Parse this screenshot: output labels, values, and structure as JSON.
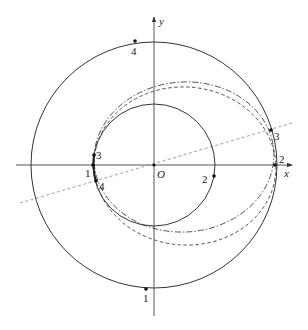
{
  "diagram": {
    "colors": {
      "line": "#333333",
      "dashed_line": "#888888",
      "background": "#ffffff"
    },
    "axes": {
      "x_label": "x",
      "y_label": "y",
      "origin_label": "O"
    },
    "inner_circle": {
      "center": [
        154,
        165
      ],
      "radius": 61,
      "style": "solid"
    },
    "outer_circle": {
      "center": [
        154,
        165
      ],
      "radius": 123,
      "style": "solid"
    },
    "transfer_orbit_dashdot": {
      "center": [
        184,
        157
      ],
      "rx": 90,
      "ry": 75,
      "rotation": -4,
      "style": "dash-dot"
    },
    "transfer_orbit_dashed": {
      "center": [
        185,
        166
      ],
      "rx": 91,
      "ry": 79,
      "rotation": 4,
      "style": "dashed"
    },
    "reference_line": {
      "from": [
        20,
        203
      ],
      "to": [
        292,
        123
      ],
      "style": "dashed",
      "passes_through": "O"
    },
    "points": [
      {
        "label": "4",
        "x": 135,
        "y": 41,
        "label_x": 131,
        "label_y": 54,
        "on": "outer circle top"
      },
      {
        "label": "1",
        "x": 146,
        "y": 289,
        "label_x": 143,
        "label_y": 302,
        "on": "outer circle bottom"
      },
      {
        "label": "3",
        "x": 271,
        "y": 130,
        "label_x": 274,
        "label_y": 139,
        "on": "outer circle right upper"
      },
      {
        "label": "2",
        "x": 275,
        "y": 165,
        "label_x": 279,
        "label_y": 163,
        "on": "outer circle right on x-axis"
      },
      {
        "label": "3",
        "x": 94,
        "y": 155,
        "label_x": 96,
        "label_y": 159,
        "on": "inner circle left upper"
      },
      {
        "label": "1",
        "x": 93,
        "y": 165,
        "label_x": 85,
        "label_y": 176,
        "on": "inner circle left on x-axis"
      },
      {
        "label": "4",
        "x": 96,
        "y": 181,
        "label_x": 99,
        "label_y": 189,
        "on": "inner circle left lower"
      },
      {
        "label": "2",
        "x": 214,
        "y": 176,
        "label_x": 202,
        "label_y": 182,
        "on": "inner circle right lower"
      }
    ]
  }
}
